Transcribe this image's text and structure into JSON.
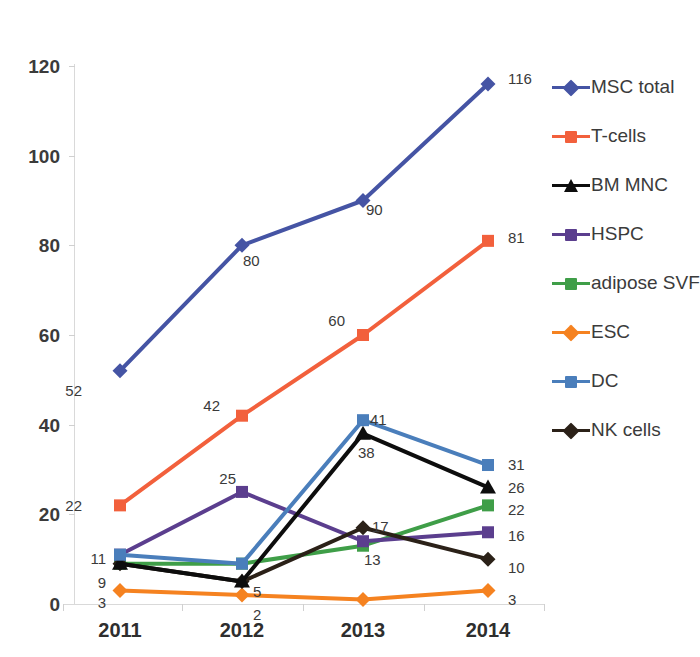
{
  "chart_data": {
    "type": "line",
    "title": "",
    "xlabel": "",
    "ylabel": "",
    "categories": [
      "2011",
      "2012",
      "2013",
      "2014"
    ],
    "ylim": [
      0,
      120
    ],
    "yticks": [
      0,
      20,
      40,
      60,
      80,
      100,
      120
    ],
    "grid": false,
    "legend_position": "right",
    "series": [
      {
        "name": "MSC total",
        "color": "#4554a4",
        "marker": "diamond",
        "values": [
          52,
          80,
          90,
          116
        ],
        "labels": [
          "52",
          "80",
          "90",
          "116"
        ]
      },
      {
        "name": "T-cells",
        "color": "#f2603c",
        "marker": "square",
        "values": [
          22,
          42,
          60,
          81
        ],
        "labels": [
          "22",
          "42",
          "60",
          "81"
        ]
      },
      {
        "name": "BM MNC",
        "color": "#0d0d0d",
        "marker": "triangle",
        "values": [
          9,
          5,
          38,
          26
        ],
        "labels": [
          "9",
          "5",
          "38",
          "26"
        ]
      },
      {
        "name": "HSPC",
        "color": "#5b3e8e",
        "marker": "square",
        "values": [
          11,
          25,
          14,
          16
        ],
        "labels": [
          "11",
          "25",
          "",
          "16"
        ]
      },
      {
        "name": "adipose SVF",
        "color": "#3f9e48",
        "marker": "square",
        "values": [
          9,
          9,
          13,
          22
        ],
        "labels": [
          "",
          "",
          "13",
          "22"
        ]
      },
      {
        "name": "ESC",
        "color": "#f58220",
        "marker": "diamond",
        "values": [
          3,
          2,
          1,
          3
        ],
        "labels": [
          "3",
          "2",
          "",
          "3"
        ]
      },
      {
        "name": "DC",
        "color": "#4a7ebb",
        "marker": "square",
        "values": [
          11,
          9,
          41,
          31
        ],
        "labels": [
          "11",
          "",
          "41",
          "31"
        ]
      },
      {
        "name": "NK cells",
        "color": "#2b2118",
        "marker": "diamond",
        "values": [
          9,
          5,
          17,
          10
        ],
        "labels": [
          "",
          "",
          "17",
          "10"
        ]
      }
    ]
  },
  "axis": {
    "y_tick_labels": [
      "120",
      "100",
      "80",
      "60",
      "40",
      "20",
      "0"
    ],
    "x_tick_labels": [
      "2011",
      "2012",
      "2013",
      "2014"
    ]
  },
  "legend": {
    "items": [
      {
        "label": "MSC total",
        "color": "#4554a4",
        "marker": "diamond"
      },
      {
        "label": "T-cells",
        "color": "#f2603c",
        "marker": "square"
      },
      {
        "label": "BM MNC",
        "color": "#0d0d0d",
        "marker": "triangle"
      },
      {
        "label": "HSPC",
        "color": "#5b3e8e",
        "marker": "square"
      },
      {
        "label": "adipose SVF",
        "color": "#3f9e48",
        "marker": "square"
      },
      {
        "label": "ESC",
        "color": "#f58220",
        "marker": "diamond"
      },
      {
        "label": "DC",
        "color": "#4a7ebb",
        "marker": "square"
      },
      {
        "label": "NK cells",
        "color": "#2b2118",
        "marker": "diamond"
      }
    ]
  },
  "point_labels": [
    {
      "text": "52",
      "x": 82,
      "y": 383,
      "align": "right"
    },
    {
      "text": "80",
      "x": 243,
      "y": 253,
      "align": "left"
    },
    {
      "text": "90",
      "x": 366,
      "y": 202,
      "align": "left"
    },
    {
      "text": "116",
      "x": 508,
      "y": 71,
      "align": "left"
    },
    {
      "text": "22",
      "x": 82,
      "y": 498,
      "align": "right"
    },
    {
      "text": "42",
      "x": 220,
      "y": 398,
      "align": "right"
    },
    {
      "text": "60",
      "x": 345,
      "y": 313,
      "align": "right"
    },
    {
      "text": "81",
      "x": 508,
      "y": 230,
      "align": "left"
    },
    {
      "text": "9",
      "x": 106,
      "y": 575,
      "align": "right"
    },
    {
      "text": "5",
      "x": 253,
      "y": 584,
      "align": "left"
    },
    {
      "text": "38",
      "x": 358,
      "y": 445,
      "align": "left"
    },
    {
      "text": "26",
      "x": 508,
      "y": 480,
      "align": "left"
    },
    {
      "text": "11",
      "x": 106,
      "y": 551,
      "align": "right"
    },
    {
      "text": "25",
      "x": 236,
      "y": 471,
      "align": "right"
    },
    {
      "text": "16",
      "x": 508,
      "y": 528,
      "align": "left"
    },
    {
      "text": "13",
      "x": 364,
      "y": 552,
      "align": "left"
    },
    {
      "text": "22",
      "x": 508,
      "y": 502,
      "align": "left"
    },
    {
      "text": "3",
      "x": 106,
      "y": 595,
      "align": "right"
    },
    {
      "text": "2",
      "x": 253,
      "y": 607,
      "align": "left"
    },
    {
      "text": "3",
      "x": 508,
      "y": 592,
      "align": "left"
    },
    {
      "text": "41",
      "x": 370,
      "y": 412,
      "align": "left"
    },
    {
      "text": "31",
      "x": 508,
      "y": 457,
      "align": "left"
    },
    {
      "text": "17",
      "x": 372,
      "y": 519,
      "align": "left"
    },
    {
      "text": "10",
      "x": 508,
      "y": 560,
      "align": "left"
    }
  ]
}
